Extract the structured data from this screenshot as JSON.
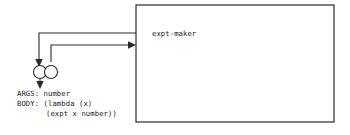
{
  "diagram": {
    "colors": {
      "stroke": "#2b2b2b",
      "text": "#1a1a1a",
      "background": "#ffffff"
    },
    "frame": {
      "label": "expt-maker",
      "label_x": 152,
      "label_y": 36,
      "box": {
        "x": 136,
        "y": 5,
        "width": 198,
        "height": 117
      }
    },
    "procedure": {
      "circles": [
        {
          "cx": 40,
          "cy": 72,
          "r": 6.5,
          "name": "procedure-left-circle"
        },
        {
          "cx": 51,
          "cy": 72,
          "r": 6.5,
          "name": "procedure-right-circle"
        }
      ],
      "text_lines": [
        {
          "text": "ARGS: number",
          "x": 17,
          "y": 96
        },
        {
          "text": "BODY: (lambda (x)",
          "x": 17,
          "y": 106
        },
        {
          "text": "(expt x number))",
          "x": 46,
          "y": 116
        }
      ],
      "args_label": "ARGS:",
      "args_value": "number",
      "body_label": "BODY:",
      "body_line_1": "(lambda (x)",
      "body_line_2": "(expt x number))"
    },
    "connectors": [
      {
        "name": "frame-to-args-pointer",
        "description": "line from frame left edge left then down into left circle",
        "path": "M 136 33 L 39 33 L 39 62",
        "arrow": {
          "x": 39,
          "y": 65,
          "dir": "down"
        }
      },
      {
        "name": "body-to-frame-pointer",
        "description": "line from right circle up then right into frame",
        "path": "M 51 62 L 51 45 L 131 45",
        "arrow": {
          "x": 134,
          "y": 45,
          "dir": "right"
        }
      },
      {
        "name": "procedure-down-pointer",
        "description": "short arrow below circle pair pointing down to text",
        "path": "M 40 79 L 40 85",
        "arrow": {
          "x": 40,
          "y": 88,
          "dir": "down"
        }
      }
    ]
  }
}
